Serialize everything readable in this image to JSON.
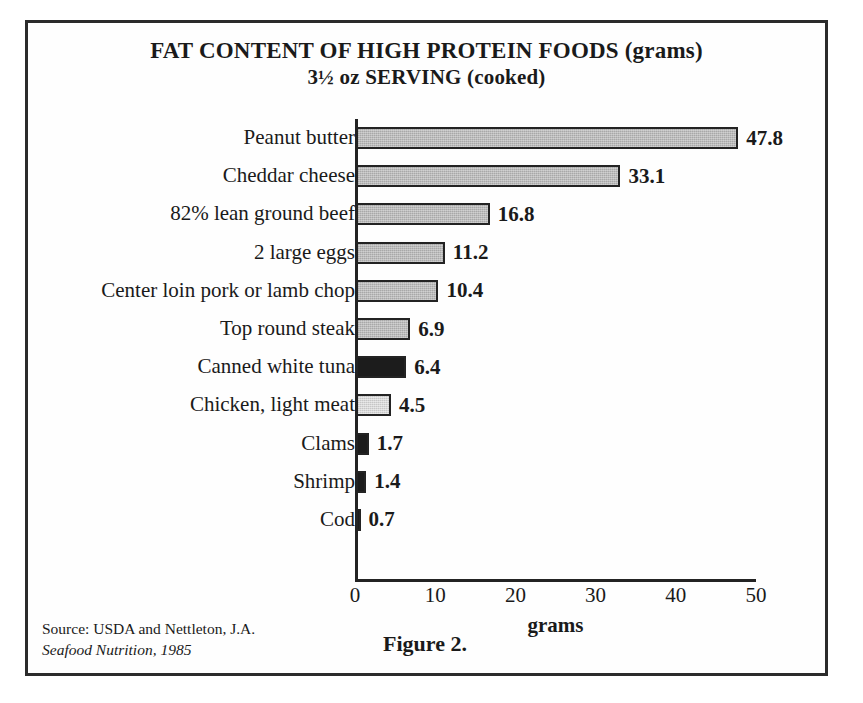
{
  "figure": {
    "title_line1": "FAT CONTENT OF HIGH PROTEIN FOODS (grams)",
    "title_line2": "3½ oz SERVING (cooked)",
    "caption": "Figure 2.",
    "source_line1": "Source: USDA and Nettleton, J.A.",
    "source_line2": "Seafood Nutrition, 1985"
  },
  "chart_data": {
    "type": "bar",
    "orientation": "horizontal",
    "title": "FAT CONTENT OF HIGH PROTEIN FOODS (grams) 3½ oz SERVING (cooked)",
    "xlabel": "grams",
    "ylabel": "",
    "xlim": [
      0,
      50
    ],
    "xticks": [
      0,
      10,
      20,
      30,
      40,
      50
    ],
    "xtick_labels": [
      "0",
      "10",
      "20",
      "30",
      "40",
      "50"
    ],
    "grid": false,
    "legend": "none",
    "categories": [
      "Peanut butter",
      "Cheddar cheese",
      "82% lean ground beef",
      "2 large eggs",
      "Center loin pork or lamb chop",
      "Top round steak",
      "Canned white tuna",
      "Chicken, light meat",
      "Clams",
      "Shrimp",
      "Cod"
    ],
    "values": [
      47.8,
      33.1,
      16.8,
      11.2,
      10.4,
      6.9,
      6.4,
      4.5,
      1.7,
      1.4,
      0.7
    ],
    "value_labels": [
      "47.8",
      "33.1",
      "16.8",
      "11.2",
      "10.4",
      "6.9",
      "6.4",
      "4.5",
      "1.7",
      "1.4",
      "0.7"
    ],
    "bar_fills": [
      "mid",
      "mid",
      "mid",
      "mid",
      "mid",
      "mid",
      "dark",
      "light",
      "dark",
      "dark",
      "dark"
    ]
  },
  "colors": {
    "fill_mid": "#a8a8a8",
    "fill_light": "#c6c6c6",
    "fill_dark": "#1c1c1c",
    "outline": "#232323",
    "background": "#ffffff"
  }
}
